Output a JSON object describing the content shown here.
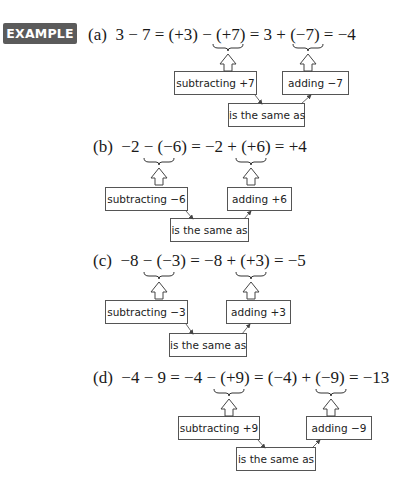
{
  "badge": {
    "label": "EXAMPLE 1",
    "color": "#5b5b5b"
  },
  "examples": [
    {
      "label": "(a)",
      "equation": "3 − 7 = (+3) − (+7) = 3 + (−7) = −4",
      "subtract_label": "subtracting +7",
      "add_label": "adding −7",
      "same_label": "is the same as"
    },
    {
      "label": "(b)",
      "equation": "−2 − (−6) = −2 + (+6) = +4",
      "subtract_label": "subtracting −6",
      "add_label": "adding +6",
      "same_label": "is the same as"
    },
    {
      "label": "(c)",
      "equation": "−8 − (−3) = −8 + (+3) = −5",
      "subtract_label": "subtracting −3",
      "add_label": "adding +3",
      "same_label": "is the same as"
    },
    {
      "label": "(d)",
      "equation": "−4 − 9 = −4 − (+9) = (−4) + (−9) = −13",
      "subtract_label": "subtracting +9",
      "add_label": "adding −9",
      "same_label": "is the same as"
    }
  ]
}
